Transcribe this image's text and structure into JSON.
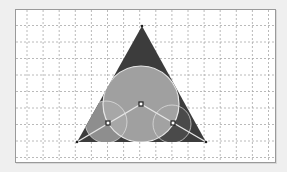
{
  "diagram": {
    "title": "",
    "grid": {
      "visible": true,
      "style": "dashed",
      "color": "#a8a8a8"
    },
    "colors": {
      "background": "#efefef",
      "canvas": "#ffffff",
      "triangle_fill": "#3c3c3c",
      "big_circle_fill": "#a9a9a9",
      "big_circle_stroke": "#e6e6e6",
      "left_circle_fill": "#8e8e8e",
      "right_circle_fill": "#4a4a4a",
      "segment_color": "#e6e6e6",
      "point_fill": "#ffffff",
      "point_stroke": "#222222"
    },
    "shapes": {
      "triangle": {
        "label": "equilateral triangle",
        "vertices": [
          "apex",
          "bottom-left",
          "bottom-right"
        ]
      },
      "circles": [
        {
          "name": "big-circle",
          "label": "inscribed circle"
        },
        {
          "name": "left-circle",
          "label": "left circle"
        },
        {
          "name": "right-circle",
          "label": "right circle"
        }
      ],
      "points": [
        "center-point",
        "left-point",
        "right-point"
      ],
      "segments": [
        "bottom-left-to-center",
        "center-to-bottom-right"
      ]
    }
  }
}
